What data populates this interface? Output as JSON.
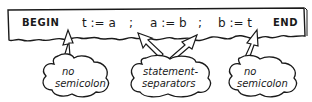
{
  "diagram": {
    "strip": {
      "begin": "BEGIN",
      "statements": [
        {
          "text": "t := a",
          "sep": ";"
        },
        {
          "text": "a := b",
          "sep": ";"
        },
        {
          "text": "b := t",
          "sep": ""
        }
      ],
      "end": "END"
    },
    "callouts": [
      {
        "id": "left",
        "line1": "no",
        "line2": "semicolon",
        "points_to": "after BEGIN"
      },
      {
        "id": "middle",
        "line1": "statement-",
        "line2": "separators",
        "points_to": "both semicolons"
      },
      {
        "id": "right",
        "line1": "no",
        "line2": "semicolon",
        "points_to": "before END"
      }
    ],
    "colors": {
      "ink": "#1a1a1a",
      "paper": "#ffffff"
    }
  }
}
